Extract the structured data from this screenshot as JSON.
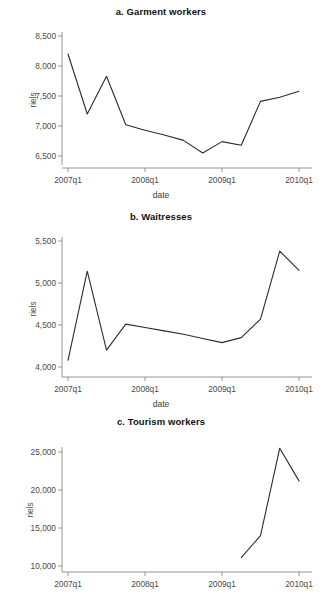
{
  "figure": {
    "background": "#ffffff",
    "line_color": "#2b2b2b",
    "axis_color": "#8a8a8a"
  },
  "labels": {
    "x_axis_title": "date",
    "y_axis_title": "riels"
  },
  "panels": [
    {
      "id": "a",
      "title": "a. Garment workers"
    },
    {
      "id": "b",
      "title": "b. Waitresses"
    },
    {
      "id": "c",
      "title": "c. Tourism workers"
    }
  ],
  "chart_data": [
    {
      "type": "line",
      "title": "a. Garment workers",
      "xlabel": "date",
      "ylabel": "riels",
      "x": [
        "2007q1",
        "2007q2",
        "2007q3",
        "2007q4",
        "2008q1",
        "2008q2",
        "2008q3",
        "2008q4",
        "2009q1",
        "2009q2",
        "2009q3",
        "2009q4",
        "2010q1"
      ],
      "values": [
        8200,
        7200,
        7830,
        7020,
        6930,
        6850,
        6760,
        6550,
        6740,
        6680,
        7410,
        7480,
        7580
      ],
      "xtick_labels": [
        "2007q1",
        "2008q1",
        "2009q1",
        "2010q1"
      ],
      "ytick_labels": [
        "6,500",
        "7,000",
        "7,500",
        "8,000",
        "8,500"
      ],
      "yticks": [
        6500,
        7000,
        7500,
        8000,
        8500
      ],
      "ylim": [
        6380,
        8620
      ],
      "xlim": [
        "2007q1",
        "2010q1"
      ],
      "grid": false,
      "legend": "none"
    },
    {
      "type": "line",
      "title": "b. Waitresses",
      "xlabel": "date",
      "ylabel": "riels",
      "x": [
        "2007q1",
        "2007q2",
        "2007q3",
        "2007q4",
        "2008q1",
        "2008q2",
        "2008q3",
        "2008q4",
        "2009q1",
        "2009q2",
        "2009q3",
        "2009q4",
        "2010q1"
      ],
      "values": [
        4080,
        5140,
        4200,
        4510,
        4470,
        4430,
        4390,
        4340,
        4290,
        4350,
        4570,
        5380,
        5150
      ],
      "xtick_labels": [
        "2007q1",
        "2008q1",
        "2009q1",
        "2010q1"
      ],
      "ytick_labels": [
        "4,000",
        "4,500",
        "5,000",
        "5,500"
      ],
      "yticks": [
        4000,
        4500,
        5000,
        5500
      ],
      "ylim": [
        3940,
        5620
      ],
      "xlim": [
        "2007q1",
        "2010q1"
      ],
      "grid": false,
      "legend": "none"
    },
    {
      "type": "line",
      "title": "c. Tourism workers",
      "xlabel": "date",
      "ylabel": "riels",
      "x": [
        "2009q2",
        "2009q3",
        "2009q4",
        "2010q1"
      ],
      "values": [
        11100,
        14000,
        25500,
        21200
      ],
      "xtick_labels": [
        "2007q1",
        "2008q1",
        "2009q1",
        "2010q1"
      ],
      "ytick_labels": [
        "10,000",
        "15,000",
        "20,000",
        "25,000"
      ],
      "yticks": [
        10000,
        15000,
        20000,
        25000
      ],
      "ylim": [
        9700,
        26200
      ],
      "xlim": [
        "2007q1",
        "2010q1"
      ],
      "grid": false,
      "legend": "none"
    }
  ]
}
